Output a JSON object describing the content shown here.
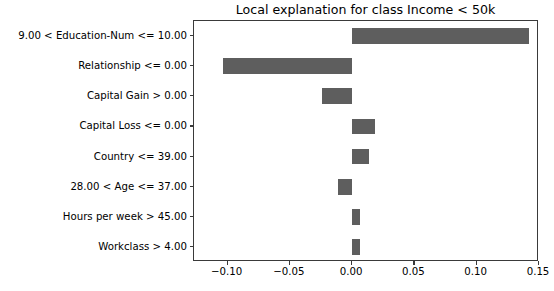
{
  "chart_data": {
    "type": "bar",
    "orientation": "horizontal",
    "title": "Local explanation for class Income < 50k",
    "xlabel": "",
    "ylabel": "",
    "grid": false,
    "legend": null,
    "xlim": [
      -0.1269,
      0.15
    ],
    "xticks": [
      -0.1,
      -0.05,
      0.0,
      0.05,
      0.1,
      0.15
    ],
    "xticklabels": [
      "−0.10",
      "−0.05",
      "0.00",
      "0.05",
      "0.10",
      "0.15"
    ],
    "categories": [
      "9.00 < Education-Num <= 10.00",
      "Relationship <= 0.00",
      "Capital Gain > 0.00",
      "Capital Loss <= 0.00",
      "Country <= 39.00",
      "28.00 < Age <= 37.00",
      "Hours per week > 45.00",
      "Workclass > 4.00"
    ],
    "values": [
      0.1423,
      -0.1039,
      -0.0239,
      0.0185,
      0.0139,
      -0.0115,
      0.0062,
      0.0062
    ],
    "bar_color": "#5e5e5e"
  },
  "figure": {
    "background": "#ffffff",
    "axis_color": "#3a3a3a"
  }
}
